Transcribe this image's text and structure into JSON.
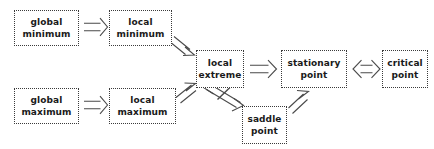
{
  "diagram": {
    "background_color": "#ffffff",
    "box_border_color": "#3a3a3a",
    "box_fill_color": "#ffffff",
    "text_color": "#1a1a1a",
    "arrow_color": "#4a4a4a",
    "nodes": [
      {
        "id": "global-minimum",
        "label": "global minimum",
        "line1": "global",
        "line2": "minimum",
        "x": 14,
        "y": 10,
        "w": 65,
        "h": 36
      },
      {
        "id": "local-minimum",
        "label": "local minimum",
        "line1": "local",
        "line2": "minimum",
        "x": 109,
        "y": 10,
        "w": 63,
        "h": 36
      },
      {
        "id": "global-maximum",
        "label": "global maximum",
        "line1": "global",
        "line2": "maximum",
        "x": 14,
        "y": 88,
        "w": 65,
        "h": 36
      },
      {
        "id": "local-maximum",
        "label": "local maximum",
        "line1": "local",
        "line2": "maximum",
        "x": 109,
        "y": 88,
        "w": 67,
        "h": 36
      },
      {
        "id": "local-extreme",
        "label": "local extreme",
        "line1": "local",
        "line2": "extreme",
        "x": 196,
        "y": 50,
        "w": 48,
        "h": 38
      },
      {
        "id": "saddle-point",
        "label": "saddle point",
        "line1": "saddle",
        "line2": "point",
        "x": 242,
        "y": 106,
        "w": 45,
        "h": 38
      },
      {
        "id": "stationary-point",
        "label": "stationary point",
        "line1": "stationary",
        "line2": "point",
        "x": 281,
        "y": 50,
        "w": 66,
        "h": 38
      },
      {
        "id": "critical-point",
        "label": "critical point",
        "line1": "critical",
        "line2": "point",
        "x": 382,
        "y": 50,
        "w": 46,
        "h": 38
      }
    ],
    "edges": [
      {
        "id": "global-min-to-local-min",
        "from": "global minimum",
        "to": "local minimum",
        "kind": "implies",
        "glyph": "=>"
      },
      {
        "id": "global-max-to-local-max",
        "from": "global maximum",
        "to": "local maximum",
        "kind": "implies",
        "glyph": "=>"
      },
      {
        "id": "local-min-to-local-extreme",
        "from": "local minimum",
        "to": "local extreme",
        "kind": "implies",
        "glyph": "=>"
      },
      {
        "id": "local-max-to-local-extreme",
        "from": "local maximum",
        "to": "local extreme",
        "kind": "implies",
        "glyph": "=>"
      },
      {
        "id": "local-extreme-not-saddle-point",
        "from": "local extreme",
        "to": "saddle point",
        "kind": "not-equivalent",
        "glyph": "<=/=>"
      },
      {
        "id": "saddle-point-to-stationary-point",
        "from": "saddle point",
        "to": "stationary point",
        "kind": "implies",
        "glyph": "=>"
      },
      {
        "id": "local-extreme-to-stationary-point",
        "from": "local extreme",
        "to": "stationary point",
        "kind": "implies",
        "glyph": "=>"
      },
      {
        "id": "stationary-point-equiv-critical-point",
        "from": "stationary point",
        "to": "critical point",
        "kind": "equivalent",
        "glyph": "<=>"
      }
    ]
  }
}
